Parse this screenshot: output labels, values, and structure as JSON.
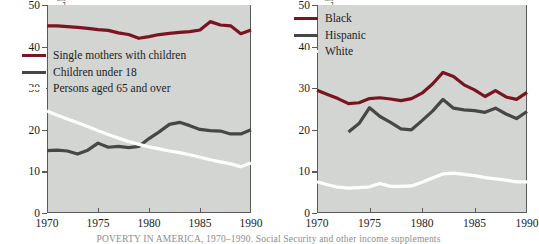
{
  "figure": {
    "caption": "POVERTY IN AMERICA, 1970–1990.  Social Security and other income supplements",
    "background_color": "#d3d5d3",
    "axis_color": "#5a5a5a"
  },
  "colors": {
    "dark_red": "#7a1420",
    "dark_gray": "#474747",
    "white": "#ffffff"
  },
  "panels": {
    "left": {
      "ylabel": "Percent of Group Living in Poverty",
      "yticks": [
        "0",
        "10",
        "20",
        "30",
        "40",
        "50"
      ],
      "xticks": [
        "1970",
        "1975",
        "1980",
        "1985",
        "1990"
      ],
      "legend": [
        {
          "label": "Single mothers with children",
          "color": "#7a1420"
        },
        {
          "label": "Children under 18",
          "color": "#474747"
        },
        {
          "label": "Persons aged 65 and over",
          "color": "#ffffff"
        }
      ]
    },
    "right": {
      "ylabel": "Percent of Group Living in Poverty",
      "yticks": [
        "0",
        "10",
        "20",
        "30",
        "40",
        "50"
      ],
      "xticks": [
        "1970",
        "1975",
        "1980",
        "1985",
        "1990"
      ],
      "legend": [
        {
          "label": "Black",
          "color": "#7a1420"
        },
        {
          "label": "Hispanic",
          "color": "#474747"
        },
        {
          "label": "White",
          "color": "#ffffff"
        }
      ]
    }
  },
  "chart_data": [
    {
      "id": "left",
      "type": "line",
      "title": "",
      "xlabel": "",
      "ylabel": "Percent of Group Living in Poverty",
      "xlim": [
        1970,
        1990
      ],
      "ylim": [
        0,
        50
      ],
      "grid": false,
      "legend_position": "inside-upper-left",
      "xticks": [
        1970,
        1975,
        1980,
        1985,
        1990
      ],
      "yticks": [
        0,
        10,
        20,
        30,
        40,
        50
      ],
      "series": [
        {
          "name": "Single mothers with children",
          "color": "#7a1420",
          "x": [
            1970,
            1971,
            1972,
            1973,
            1974,
            1975,
            1976,
            1977,
            1978,
            1979,
            1980,
            1981,
            1982,
            1983,
            1984,
            1985,
            1986,
            1987,
            1988,
            1989,
            1990
          ],
          "values": [
            45.0,
            45.0,
            44.8,
            44.6,
            44.4,
            44.1,
            43.9,
            43.3,
            42.9,
            42.0,
            42.4,
            42.9,
            43.2,
            43.4,
            43.6,
            44.0,
            46.0,
            45.2,
            45.0,
            43.1,
            44.0
          ]
        },
        {
          "name": "Children under 18",
          "color": "#474747",
          "x": [
            1970,
            1971,
            1972,
            1973,
            1974,
            1975,
            1976,
            1977,
            1978,
            1979,
            1980,
            1981,
            1982,
            1983,
            1984,
            1985,
            1986,
            1987,
            1988,
            1989,
            1990
          ],
          "values": [
            15.0,
            15.1,
            14.9,
            14.2,
            15.1,
            16.8,
            15.8,
            16.0,
            15.7,
            16.0,
            17.9,
            19.5,
            21.3,
            21.8,
            21.0,
            20.1,
            19.8,
            19.7,
            19.0,
            19.0,
            20.0
          ]
        },
        {
          "name": "Persons aged 65 and over",
          "color": "#ffffff",
          "x": [
            1970,
            1971,
            1972,
            1973,
            1974,
            1975,
            1976,
            1977,
            1978,
            1979,
            1980,
            1981,
            1982,
            1983,
            1984,
            1985,
            1986,
            1987,
            1988,
            1989,
            1990
          ],
          "values": [
            24.5,
            23.5,
            22.6,
            21.7,
            20.8,
            19.8,
            18.9,
            18.0,
            17.2,
            16.5,
            15.9,
            15.4,
            14.9,
            14.5,
            14.0,
            13.4,
            12.8,
            12.3,
            11.8,
            11.1,
            12.0
          ]
        }
      ]
    },
    {
      "id": "right",
      "type": "line",
      "title": "",
      "xlabel": "",
      "ylabel": "Percent of Group Living in Poverty",
      "xlim": [
        1970,
        1990
      ],
      "ylim": [
        0,
        50
      ],
      "grid": false,
      "legend_position": "inside-upper-left",
      "xticks": [
        1970,
        1975,
        1980,
        1985,
        1990
      ],
      "yticks": [
        0,
        10,
        20,
        30,
        40,
        50
      ],
      "series": [
        {
          "name": "Black",
          "color": "#7a1420",
          "x": [
            1970,
            1971,
            1972,
            1973,
            1974,
            1975,
            1976,
            1977,
            1978,
            1979,
            1980,
            1981,
            1982,
            1983,
            1984,
            1985,
            1986,
            1987,
            1988,
            1989,
            1990
          ],
          "values": [
            29.5,
            28.5,
            27.5,
            26.3,
            26.5,
            27.5,
            27.7,
            27.4,
            27.0,
            27.5,
            28.8,
            31.0,
            33.8,
            32.8,
            30.8,
            29.6,
            28.0,
            29.4,
            27.9,
            27.3,
            29.0
          ]
        },
        {
          "name": "Hispanic",
          "color": "#474747",
          "x": [
            1973,
            1974,
            1975,
            1976,
            1977,
            1978,
            1979,
            1980,
            1981,
            1982,
            1983,
            1984,
            1985,
            1986,
            1987,
            1988,
            1989,
            1990
          ],
          "values": [
            19.5,
            21.5,
            25.3,
            23.2,
            21.8,
            20.2,
            20.0,
            22.2,
            24.5,
            27.3,
            25.2,
            24.8,
            24.6,
            24.2,
            25.2,
            23.8,
            22.7,
            24.4
          ]
        },
        {
          "name": "White",
          "color": "#ffffff",
          "x": [
            1970,
            1971,
            1972,
            1973,
            1974,
            1975,
            1976,
            1977,
            1978,
            1979,
            1980,
            1981,
            1982,
            1983,
            1984,
            1985,
            1986,
            1987,
            1988,
            1989,
            1990
          ],
          "values": [
            7.5,
            6.8,
            6.2,
            6.0,
            6.1,
            6.3,
            7.1,
            6.4,
            6.4,
            6.5,
            7.4,
            8.4,
            9.4,
            9.6,
            9.3,
            9.0,
            8.5,
            8.2,
            7.9,
            7.5,
            7.5
          ]
        }
      ]
    }
  ]
}
